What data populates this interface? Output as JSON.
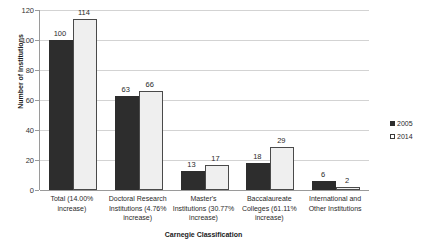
{
  "chart_data": {
    "type": "bar",
    "title": "",
    "xlabel": "Carnegie Classification",
    "ylabel": "Number of Institutions",
    "categories": [
      "Total (14.00% increase)",
      "Doctoral Research Institutions (4.76% increase)",
      "Master's Institutions (30.77% increase)",
      "Baccalaureate Colleges (61.11% increase)",
      "International and Other Institutions"
    ],
    "series": [
      {
        "name": "2005",
        "values": [
          100,
          63,
          13,
          18,
          6
        ],
        "color": "#2d2d2d"
      },
      {
        "name": "2014",
        "values": [
          114,
          66,
          17,
          29,
          2
        ],
        "color": "#efefef"
      }
    ],
    "ylim": [
      0,
      120
    ],
    "yticks": [
      0,
      20,
      40,
      60,
      80,
      100,
      120
    ],
    "ytick_labels": [
      "0",
      "20",
      "40",
      "60",
      "80",
      "100",
      "120"
    ],
    "grid": true,
    "legend_position": "right",
    "data_labels": [
      "100",
      "114",
      "63",
      "66",
      "13",
      "17",
      "18",
      "29",
      "6",
      "2"
    ]
  },
  "axes": {
    "y_title": "Number of Institutions",
    "x_title": "Carnegie Classification",
    "y_ticks": [
      {
        "label": "120",
        "value": 120
      },
      {
        "label": "100",
        "value": 100
      },
      {
        "label": "80",
        "value": 80
      },
      {
        "label": "60",
        "value": 60
      },
      {
        "label": "40",
        "value": 40
      },
      {
        "label": "20",
        "value": 20
      },
      {
        "label": "0",
        "value": 0
      }
    ]
  },
  "categories": [
    {
      "line1": "Total (14.00%",
      "line2": "increase)",
      "line3": ""
    },
    {
      "line1": "Doctoral Research",
      "line2": "Institutions (4.76%",
      "line3": "increase)"
    },
    {
      "line1": "Master's",
      "line2": "Institutions (30.77%",
      "line3": "increase)"
    },
    {
      "line1": "Baccalaureate",
      "line2": "Colleges (61.11%",
      "line3": "increase)"
    },
    {
      "line1": "International and",
      "line2": "Other Institutions",
      "line3": ""
    }
  ],
  "bars": [
    {
      "label": "100",
      "series": "2005",
      "group": 0
    },
    {
      "label": "114",
      "series": "2014",
      "group": 0
    },
    {
      "label": "63",
      "series": "2005",
      "group": 1
    },
    {
      "label": "66",
      "series": "2014",
      "group": 1
    },
    {
      "label": "13",
      "series": "2005",
      "group": 2
    },
    {
      "label": "17",
      "series": "2014",
      "group": 2
    },
    {
      "label": "18",
      "series": "2005",
      "group": 3
    },
    {
      "label": "29",
      "series": "2014",
      "group": 3
    },
    {
      "label": "6",
      "series": "2005",
      "group": 4
    },
    {
      "label": "2",
      "series": "2014",
      "group": 4
    }
  ],
  "legend": {
    "items": [
      {
        "label": "2005",
        "swatch": "filled-dark-square"
      },
      {
        "label": "2014",
        "swatch": "open-white-square"
      }
    ]
  }
}
